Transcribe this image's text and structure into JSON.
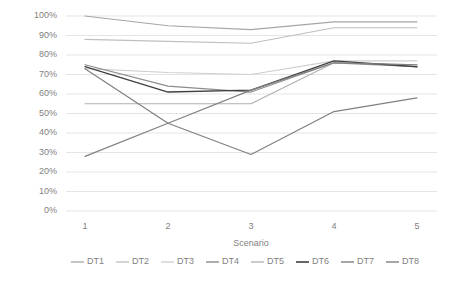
{
  "chart_data": {
    "type": "line",
    "title": "",
    "xlabel": "Scenario",
    "ylabel": "",
    "categories": [
      "1",
      "2",
      "3",
      "4",
      "5"
    ],
    "x": [
      1,
      2,
      3,
      4,
      5
    ],
    "ylim": [
      0,
      1.0
    ],
    "ytick_labels": [
      "0%",
      "10%",
      "20%",
      "30%",
      "40%",
      "50%",
      "60%",
      "70%",
      "80%",
      "90%",
      "100%"
    ],
    "ytick_values": [
      0,
      10,
      20,
      30,
      40,
      50,
      60,
      70,
      80,
      90,
      100
    ],
    "grid": true,
    "legend_position": "bottom",
    "series": [
      {
        "name": "DT1",
        "color": "#a6a6a6",
        "width": 1.1,
        "values": [
          100,
          95,
          93,
          97,
          97
        ]
      },
      {
        "name": "DT2",
        "color": "#bfbfbf",
        "width": 1.1,
        "values": [
          88,
          87,
          86,
          94,
          94
        ]
      },
      {
        "name": "DT3",
        "color": "#cfcfcf",
        "width": 1.1,
        "values": [
          73,
          71,
          70,
          77,
          77
        ]
      },
      {
        "name": "DT4",
        "color": "#8c8c8c",
        "width": 1.2,
        "values": [
          75,
          64,
          61,
          76,
          74
        ]
      },
      {
        "name": "DT5",
        "color": "#b0b0b0",
        "width": 1.1,
        "values": [
          55,
          55,
          55,
          76,
          75
        ]
      },
      {
        "name": "DT6",
        "color": "#404040",
        "width": 1.4,
        "values": [
          74,
          61,
          62,
          77,
          74
        ]
      },
      {
        "name": "DT7",
        "color": "#808080",
        "width": 1.2,
        "values": [
          73,
          45,
          29,
          51,
          58
        ]
      },
      {
        "name": "DT8",
        "color": "#808080",
        "width": 1.2,
        "values": [
          28,
          45,
          62,
          76,
          75
        ]
      }
    ]
  },
  "axis": {
    "x_title": "Scenario"
  },
  "legend": {
    "items": [
      "DT1",
      "DT2",
      "DT3",
      "DT4",
      "DT5",
      "DT6",
      "DT7",
      "DT8"
    ]
  },
  "colors": {
    "gridline": "#d9d9d9",
    "text": "#7f7f7f",
    "background": "#ffffff"
  }
}
